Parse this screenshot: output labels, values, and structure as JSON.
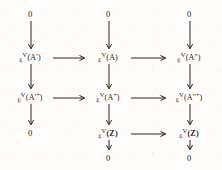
{
  "diagram": {
    "kind": "commutative-diagram",
    "ink_color": "#2a2724",
    "background_color": "#fdfcfa",
    "columns": 3,
    "rows": 5,
    "zero_label": "0",
    "epsilon": "ε",
    "vee": "V",
    "lparen": "(",
    "rparen": ")",
    "prime_single": "'",
    "prime_double": "''",
    "plus": "+",
    "nodes": [
      {
        "id": "c1r1",
        "type": "zero",
        "text": "0",
        "col": 1,
        "row": 1
      },
      {
        "id": "c2r1",
        "type": "zero",
        "text": "0",
        "col": 2,
        "row": 1
      },
      {
        "id": "c3r1",
        "type": "zero",
        "text": "0",
        "col": 3,
        "row": 1
      },
      {
        "id": "c1r2",
        "type": "object",
        "arg": "A",
        "mark": "'",
        "sup": "",
        "bold": false,
        "col": 1,
        "row": 2
      },
      {
        "id": "c2r2",
        "type": "object",
        "arg": "A",
        "mark": "",
        "sup": "",
        "bold": false,
        "col": 2,
        "row": 2
      },
      {
        "id": "c3r2",
        "type": "object",
        "arg": "A",
        "mark": "''",
        "sup": "",
        "bold": false,
        "col": 3,
        "row": 2
      },
      {
        "id": "c1r3",
        "type": "object",
        "arg": "A",
        "mark": "'",
        "sup": "+",
        "bold": false,
        "col": 1,
        "row": 3
      },
      {
        "id": "c2r3",
        "type": "object",
        "arg": "A",
        "mark": "",
        "sup": "+",
        "bold": false,
        "col": 2,
        "row": 3
      },
      {
        "id": "c3r3",
        "type": "object",
        "arg": "A",
        "mark": "''",
        "sup": "+",
        "bold": false,
        "col": 3,
        "row": 3
      },
      {
        "id": "c2r4",
        "type": "object",
        "arg": "Z",
        "mark": "",
        "sup": "",
        "bold": true,
        "col": 2,
        "row": 4
      },
      {
        "id": "c3r4",
        "type": "object",
        "arg": "Z",
        "mark": "",
        "sup": "",
        "bold": true,
        "col": 3,
        "row": 4
      },
      {
        "id": "c1r4",
        "type": "zero",
        "text": "0",
        "col": 1,
        "row": 4
      },
      {
        "id": "c2r5",
        "type": "zero",
        "text": "0",
        "col": 2,
        "row": 5
      },
      {
        "id": "c3r5",
        "type": "zero",
        "text": "0",
        "col": 3,
        "row": 5
      }
    ],
    "vertical_arrows": [
      {
        "id": "v-c1-r1r2",
        "from": "c1r1",
        "to": "c1r2"
      },
      {
        "id": "v-c2-r1r2",
        "from": "c2r1",
        "to": "c2r2"
      },
      {
        "id": "v-c3-r1r2",
        "from": "c3r1",
        "to": "c3r2"
      },
      {
        "id": "v-c1-r2r3",
        "from": "c1r2",
        "to": "c1r3"
      },
      {
        "id": "v-c2-r2r3",
        "from": "c2r2",
        "to": "c2r3"
      },
      {
        "id": "v-c3-r2r3",
        "from": "c3r2",
        "to": "c3r3"
      },
      {
        "id": "v-c1-r3r4",
        "from": "c1r3",
        "to": "c1r4"
      },
      {
        "id": "v-c2-r3r4",
        "from": "c2r3",
        "to": "c2r4"
      },
      {
        "id": "v-c3-r3r4",
        "from": "c3r3",
        "to": "c3r4"
      },
      {
        "id": "v-c2-r4r5",
        "from": "c2r4",
        "to": "c2r5"
      },
      {
        "id": "v-c3-r4r5",
        "from": "c3r4",
        "to": "c3r5"
      }
    ],
    "horizontal_arrows": [
      {
        "id": "h-r2-c1c2",
        "from": "c1r2",
        "to": "c2r2"
      },
      {
        "id": "h-r2-c2c3",
        "from": "c2r2",
        "to": "c3r2"
      },
      {
        "id": "h-r3-c1c2",
        "from": "c1r3",
        "to": "c2r3"
      },
      {
        "id": "h-r3-c2c3",
        "from": "c2r3",
        "to": "c3r3"
      },
      {
        "id": "h-r4-c2c3",
        "from": "c2r4",
        "to": "c3r4"
      }
    ]
  }
}
